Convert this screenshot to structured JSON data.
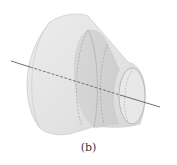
{
  "figure": {
    "caption": "(b)",
    "colors": {
      "background": "#ffffff",
      "outer_surface": "#e4e4e4",
      "inner_band": "#d2d2d2",
      "edge": "#b8b8b8",
      "axis": "#4a4a4a",
      "hidden_lines": "#8c8c8c"
    }
  }
}
